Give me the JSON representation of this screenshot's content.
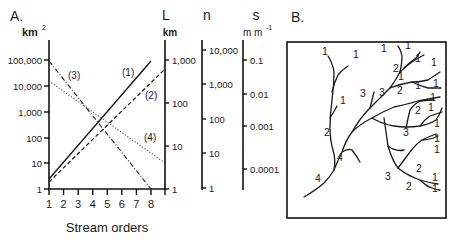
{
  "panel_a": {
    "label": "A.",
    "left_axis": {
      "unit": "km",
      "unit_sup": "2",
      "ticks": [
        {
          "label": "1",
          "y": 189
        },
        {
          "label": "10",
          "y": 163
        },
        {
          "label": "100",
          "y": 138
        },
        {
          "label": "1,000",
          "y": 112
        },
        {
          "label": "10,000",
          "y": 86
        },
        {
          "label": "100,000",
          "y": 60
        }
      ]
    },
    "L_axis": {
      "title": "L",
      "unit": "km",
      "ticks": [
        {
          "label": "1",
          "y": 189
        },
        {
          "label": "10",
          "y": 146
        },
        {
          "label": "100",
          "y": 103
        },
        {
          "label": "1,000",
          "y": 60
        }
      ]
    },
    "n_axis": {
      "title": "n",
      "ticks": [
        {
          "label": "1",
          "y": 188
        },
        {
          "label": "10",
          "y": 153
        },
        {
          "label": "100",
          "y": 119
        },
        {
          "label": "1,000",
          "y": 84
        },
        {
          "label": "10,000",
          "y": 50
        }
      ]
    },
    "s_axis": {
      "title": "s",
      "unit": "m m",
      "unit_sup": "-1",
      "ticks": [
        {
          "label": "0.1",
          "y": 60
        },
        {
          "label": "0.01",
          "y": 94
        },
        {
          "label": "0.001",
          "y": 126
        },
        {
          "label": "0.0001",
          "y": 169
        }
      ]
    },
    "x_axis": {
      "label": "Stream orders",
      "ticks": [
        "1",
        "2",
        "3",
        "4",
        "5",
        "6",
        "7",
        "8"
      ]
    },
    "series_labels": [
      "(1)",
      "(2)",
      "(3)",
      "(4)"
    ]
  },
  "panel_b": {
    "label": "B.",
    "order_labels": [
      {
        "text": "1",
        "x": 322,
        "y": 55
      },
      {
        "text": "1",
        "x": 353,
        "y": 58
      },
      {
        "text": "1",
        "x": 381,
        "y": 52
      },
      {
        "text": "1",
        "x": 405,
        "y": 49
      },
      {
        "text": "1",
        "x": 415,
        "y": 62
      },
      {
        "text": "2",
        "x": 393,
        "y": 72
      },
      {
        "text": "1",
        "x": 398,
        "y": 80
      },
      {
        "text": "1",
        "x": 431,
        "y": 66
      },
      {
        "text": "3",
        "x": 360,
        "y": 97
      },
      {
        "text": "3",
        "x": 379,
        "y": 96
      },
      {
        "text": "2",
        "x": 397,
        "y": 94
      },
      {
        "text": "1",
        "x": 415,
        "y": 89
      },
      {
        "text": "1",
        "x": 433,
        "y": 87
      },
      {
        "text": "1",
        "x": 340,
        "y": 104
      },
      {
        "text": "1",
        "x": 430,
        "y": 101
      },
      {
        "text": "2",
        "x": 415,
        "y": 114
      },
      {
        "text": "1",
        "x": 428,
        "y": 111
      },
      {
        "text": "2",
        "x": 324,
        "y": 136
      },
      {
        "text": "3",
        "x": 403,
        "y": 136
      },
      {
        "text": "1",
        "x": 434,
        "y": 127
      },
      {
        "text": "4",
        "x": 337,
        "y": 161
      },
      {
        "text": "1",
        "x": 434,
        "y": 142
      },
      {
        "text": "1",
        "x": 434,
        "y": 153
      },
      {
        "text": "2",
        "x": 416,
        "y": 172
      },
      {
        "text": "4",
        "x": 315,
        "y": 182
      },
      {
        "text": "3",
        "x": 385,
        "y": 180
      },
      {
        "text": "1",
        "x": 432,
        "y": 181
      },
      {
        "text": "2",
        "x": 406,
        "y": 190
      },
      {
        "text": "1",
        "x": 432,
        "y": 192
      }
    ]
  },
  "chart_data": {
    "type": "line",
    "title": "A.",
    "xlabel": "Stream orders",
    "x": [
      1,
      2,
      3,
      4,
      5,
      6,
      7,
      8
    ],
    "y_scale": "log",
    "axes": [
      {
        "name": "Area",
        "unit": "km^2",
        "range": [
          1,
          100000
        ]
      },
      {
        "name": "L",
        "unit": "km",
        "range": [
          1,
          1000
        ]
      },
      {
        "name": "n",
        "unit": "",
        "range": [
          1,
          10000
        ]
      },
      {
        "name": "s",
        "unit": "m m^-1",
        "range": [
          0.0001,
          0.1
        ]
      }
    ],
    "series": [
      {
        "name": "(1)",
        "style": "solid",
        "axis": "Area km^2",
        "x_range": [
          1,
          8
        ],
        "values_approx": [
          2.5,
          100000
        ]
      },
      {
        "name": "(2)",
        "style": "dashed",
        "axis": "L km",
        "x_range": [
          1,
          9
        ],
        "values_approx": [
          1.5,
          900
        ]
      },
      {
        "name": "(3)",
        "style": "dash-dot",
        "axis": "n",
        "x_range": [
          1,
          8
        ],
        "values_approx": [
          10000,
          1
        ]
      },
      {
        "name": "(4)",
        "style": "dotted",
        "axis": "s m m^-1",
        "x_range": [
          1,
          9
        ],
        "values_approx": [
          0.05,
          0.0003
        ]
      }
    ]
  }
}
